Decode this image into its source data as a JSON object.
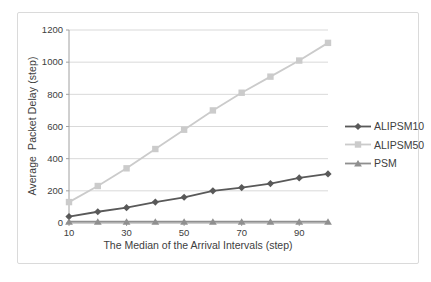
{
  "chart_data": {
    "type": "line",
    "title": "",
    "xlabel": "The Median of the Arrival Intervals (step)",
    "ylabel": "Average  Packet Delay (step)",
    "x": [
      10,
      20,
      30,
      40,
      50,
      60,
      70,
      80,
      90,
      100
    ],
    "x_tick_labels": [
      10,
      30,
      50,
      70,
      90
    ],
    "ylim": [
      0,
      1200
    ],
    "ytick_step": 200,
    "grid": "horizontal",
    "legend_position": "right",
    "series": [
      {
        "name": "ALIPSM10",
        "marker": "diamond",
        "color": "#595959",
        "values": [
          40,
          70,
          95,
          130,
          160,
          200,
          220,
          245,
          280,
          305
        ]
      },
      {
        "name": "ALIPSM50",
        "marker": "square",
        "color": "#cbcbcb",
        "values": [
          130,
          230,
          340,
          460,
          580,
          700,
          810,
          910,
          1010,
          1120
        ]
      },
      {
        "name": "PSM",
        "marker": "triangle",
        "color": "#8f8f8f",
        "values": [
          8,
          8,
          8,
          8,
          8,
          8,
          8,
          8,
          8,
          8
        ]
      }
    ]
  },
  "colors": {
    "gridline": "#d9d9d9",
    "axis_line": "#a0a0a0",
    "tick_text": "#404040",
    "frame_border": "#dadada",
    "background": "#ffffff"
  }
}
